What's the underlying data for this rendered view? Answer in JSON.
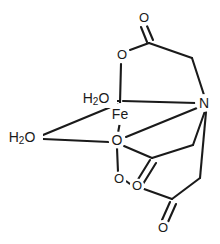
{
  "figure": {
    "background_color": "#ffffff",
    "line_color": "#1a1a1a",
    "width": 220,
    "height": 244
  },
  "atoms": {
    "metal_center": {
      "label": "Fe",
      "element": "Fe",
      "x": 120,
      "y": 114
    },
    "nitrogen": {
      "label": "N",
      "element": "N",
      "x": 204,
      "y": 103
    },
    "water_top": {
      "label_main": "H",
      "label_sub": "2",
      "label_tail": "O",
      "full": "H2O",
      "x": 96,
      "y": 98
    },
    "water_left": {
      "label_main": "H",
      "label_sub": "2",
      "label_tail": "O",
      "full": "H2O",
      "x": 22,
      "y": 137
    },
    "oxygen_ester_top": {
      "label": "O",
      "element": "O",
      "x": 122,
      "y": 55
    },
    "oxygen_carbonyl_top": {
      "label": "O",
      "element": "O",
      "x": 144,
      "y": 18
    },
    "oxygen_center": {
      "label": "O",
      "element": "O",
      "x": 117,
      "y": 140
    },
    "oxygen_lower_left": {
      "label": "O",
      "element": "O",
      "x": 119,
      "y": 179
    },
    "oxygen_lower_right": {
      "label": "O",
      "element": "O",
      "x": 137,
      "y": 186
    },
    "oxygen_carbonyl_mid": {
      "label": "O",
      "element": "O",
      "x": 133,
      "y": 187
    },
    "oxygen_carbonyl_bottom": {
      "label": "O",
      "element": "O",
      "x": 163,
      "y": 228
    }
  },
  "bonds": [
    {
      "name": "Fe-O-ester-top",
      "from": "metal_center",
      "to": "oxygen_ester_top",
      "order": 1
    },
    {
      "name": "Fe-N",
      "from": "metal_center",
      "to": "nitrogen",
      "order": 1
    },
    {
      "name": "Fe-OH2-top",
      "from": "metal_center",
      "to": "water_top",
      "order": 1
    },
    {
      "name": "Fe-OH2-left",
      "from": "metal_center",
      "to": "water_left",
      "order": 1
    },
    {
      "name": "Fe-O-center",
      "from": "metal_center",
      "to": "oxygen_center",
      "order": 1
    },
    {
      "name": "O-center-to-water-left",
      "from": "oxygen_center",
      "to": "water_left",
      "order": 1
    },
    {
      "name": "O-center-to-N",
      "from": "oxygen_center",
      "to": "nitrogen",
      "order": 1
    },
    {
      "name": "O-ester-top-to-carbonyl-C",
      "from": "oxygen_ester_top",
      "to": "carbon_top",
      "order": 1
    },
    {
      "name": "carbonyl-top-double",
      "from": "carbon_top",
      "to": "oxygen_carbonyl_top",
      "order": 2
    },
    {
      "name": "carbon-top-to-CH2",
      "from": "carbon_top",
      "to": "carbon_top_ch2",
      "order": 1
    },
    {
      "name": "CH2-to-N",
      "from": "carbon_top_ch2",
      "to": "nitrogen",
      "order": 1
    },
    {
      "name": "N-to-CH2-mid",
      "from": "nitrogen",
      "to": "carbon_mid_ch2",
      "order": 1
    },
    {
      "name": "CH2-mid-to-carbonyl-C",
      "from": "carbon_mid_ch2",
      "to": "carbon_mid",
      "order": 1
    },
    {
      "name": "carbonyl-mid-double",
      "from": "carbon_mid",
      "to": "oxygen_carbonyl_mid",
      "order": 2
    },
    {
      "name": "carbon-mid-to-O-center",
      "from": "carbon_mid",
      "to": "oxygen_center",
      "order": 1
    },
    {
      "name": "O-center-to-O-lower-left",
      "from": "oxygen_center",
      "to": "oxygen_lower_left",
      "order": 1
    },
    {
      "name": "O-lower-left-to-O-lower-right",
      "from": "oxygen_lower_left",
      "to": "oxygen_lower_right",
      "order": 1
    },
    {
      "name": "O-lower-right-to-carbon-bottom",
      "from": "oxygen_lower_right",
      "to": "carbon_bottom",
      "order": 1
    },
    {
      "name": "carbonyl-bottom-double",
      "from": "carbon_bottom",
      "to": "oxygen_carbonyl_bottom",
      "order": 2
    },
    {
      "name": "carbon-bottom-to-CH2-bottom",
      "from": "carbon_bottom",
      "to": "carbon_bottom_ch2",
      "order": 1
    },
    {
      "name": "CH2-bottom-to-N",
      "from": "carbon_bottom_ch2",
      "to": "nitrogen",
      "order": 1
    }
  ]
}
